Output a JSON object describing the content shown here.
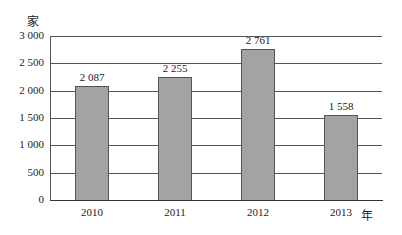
{
  "chart_data": {
    "type": "bar",
    "title": "",
    "xlabel": "年",
    "ylabel": "家",
    "categories": [
      "2010",
      "2011",
      "2012",
      "2013"
    ],
    "values": [
      2087,
      2255,
      2761,
      1558
    ],
    "value_labels": [
      "2 087",
      "2 255",
      "2 761",
      "1 558"
    ],
    "ylim": [
      0,
      3000
    ],
    "yticks": [
      0,
      500,
      1000,
      1500,
      2000,
      2500,
      3000
    ],
    "ytick_labels": [
      "0",
      "500",
      "1 000",
      "1 500",
      "2 000",
      "2 500",
      "3 000"
    ],
    "grid": true,
    "legend": null,
    "colors": {
      "bar": "#a3a3a3",
      "bar_border": "#555555",
      "grid": "#555555"
    }
  }
}
